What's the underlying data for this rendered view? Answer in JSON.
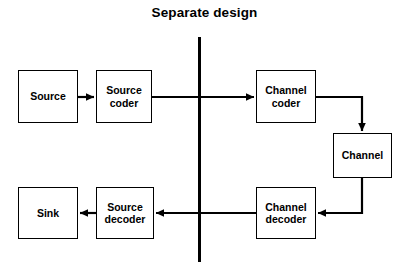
{
  "diagram": {
    "title": "Separate design",
    "background_color": "#ffffff",
    "line_color": "#000000",
    "box_fill": "#ffffff",
    "divider": {
      "name": "vertical-divider-line",
      "orientation": "vertical",
      "x": 199,
      "y1": 37,
      "y2": 262,
      "width": 3
    },
    "nodes": [
      {
        "id": "source",
        "label": "Source",
        "x": 18,
        "y": 70,
        "w": 60,
        "h": 53
      },
      {
        "id": "source-coder",
        "label": "Source\ncoder",
        "x": 96,
        "y": 70,
        "w": 56,
        "h": 53
      },
      {
        "id": "channel-coder",
        "label": "Channel\ncoder",
        "x": 256,
        "y": 70,
        "w": 60,
        "h": 53
      },
      {
        "id": "channel",
        "label": "Channel",
        "x": 333,
        "y": 133,
        "w": 59,
        "h": 45
      },
      {
        "id": "channel-decoder",
        "label": "Channel\ndecoder",
        "x": 256,
        "y": 187,
        "w": 60,
        "h": 52
      },
      {
        "id": "source-decoder",
        "label": "Source\ndecoder",
        "x": 96,
        "y": 187,
        "w": 58,
        "h": 52
      },
      {
        "id": "sink",
        "label": "Sink",
        "x": 18,
        "y": 187,
        "w": 60,
        "h": 52
      }
    ],
    "edges": [
      {
        "id": "source-to-source-coder",
        "from": "source",
        "to": "source-coder",
        "path": "M 78 97 L 94 97",
        "arrow": "right"
      },
      {
        "id": "source-coder-to-channel-coder",
        "from": "source-coder",
        "to": "channel-coder",
        "path": "M 152 97 L 254 97",
        "arrow": "right"
      },
      {
        "id": "channel-coder-to-channel",
        "from": "channel-coder",
        "to": "channel",
        "path": "M 316 97 L 362 97 L 362 131",
        "arrow": "down"
      },
      {
        "id": "channel-to-channel-decoder",
        "from": "channel",
        "to": "channel-decoder",
        "path": "M 362 178 L 362 213 L 318 213",
        "arrow": "left"
      },
      {
        "id": "channel-decoder-to-source-decoder",
        "from": "channel-decoder",
        "to": "source-decoder",
        "path": "M 256 213 L 156 213",
        "arrow": "left"
      },
      {
        "id": "source-decoder-to-sink",
        "from": "source-decoder",
        "to": "sink",
        "path": "M 96 213 L 80 213",
        "arrow": "left"
      }
    ]
  }
}
